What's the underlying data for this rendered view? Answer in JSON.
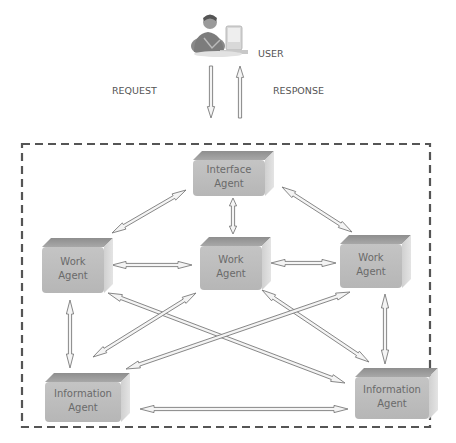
{
  "diagram": {
    "user": {
      "label": "USER",
      "icon": "user-at-computer-icon"
    },
    "request_label": "REQUEST",
    "response_label": "RESPONSE",
    "boundary": "dashed-system-boundary",
    "agents": [
      {
        "id": "interface",
        "line1": "Interface",
        "line2": "Agent"
      },
      {
        "id": "work-left",
        "line1": "Work",
        "line2": "Agent"
      },
      {
        "id": "work-center",
        "line1": "Work",
        "line2": "Agent"
      },
      {
        "id": "work-right",
        "line1": "Work",
        "line2": "Agent"
      },
      {
        "id": "info-left",
        "line1": "Information",
        "line2": "Agent"
      },
      {
        "id": "info-right",
        "line1": "Information",
        "line2": "Agent"
      }
    ],
    "connections": [
      {
        "from": "user",
        "to": "interface",
        "kind": "request",
        "direction": "one-way"
      },
      {
        "from": "interface",
        "to": "user",
        "kind": "response",
        "direction": "one-way"
      },
      {
        "from": "interface",
        "to": "work-left",
        "direction": "two-way"
      },
      {
        "from": "interface",
        "to": "work-center",
        "direction": "two-way"
      },
      {
        "from": "interface",
        "to": "work-right",
        "direction": "two-way"
      },
      {
        "from": "work-left",
        "to": "work-center",
        "direction": "two-way"
      },
      {
        "from": "work-center",
        "to": "work-right",
        "direction": "two-way"
      },
      {
        "from": "work-left",
        "to": "info-left",
        "direction": "two-way"
      },
      {
        "from": "work-right",
        "to": "info-right",
        "direction": "two-way"
      },
      {
        "from": "work-left",
        "to": "info-right",
        "direction": "two-way"
      },
      {
        "from": "work-center",
        "to": "info-left",
        "direction": "two-way"
      },
      {
        "from": "work-center",
        "to": "info-right",
        "direction": "two-way"
      },
      {
        "from": "work-right",
        "to": "info-left",
        "direction": "two-way"
      },
      {
        "from": "info-left",
        "to": "info-right",
        "direction": "two-way"
      }
    ],
    "colors": {
      "box_front": "#bdbdbd",
      "box_top": "#9a9a9a",
      "box_side": "#d6d6d6",
      "arrow_fill": "#f4f4f4",
      "arrow_stroke": "#7a7a7a",
      "border": "#555555",
      "text": "#666666"
    }
  }
}
